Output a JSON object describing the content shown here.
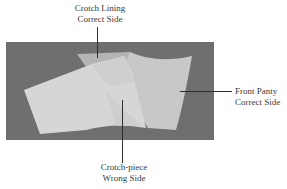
{
  "figure": {
    "labels": {
      "top": {
        "line1": "Crotch Lining",
        "line2": "Correct Side"
      },
      "right": {
        "line1": "Front Panty",
        "line2": "Correct Side"
      },
      "bottom": {
        "line1": "Crotch-piece",
        "line2": "Wrong Side"
      }
    },
    "colors": {
      "background": "#6f6f6f",
      "fabric_light": "#d4d4d4",
      "fabric_mid": "#c3c3c3",
      "fabric_lining": "#b4b4b4",
      "leader_line": "#2e2e2e"
    }
  }
}
